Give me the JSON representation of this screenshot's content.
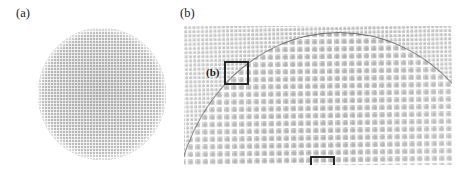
{
  "figure": {
    "background_color": "#ffffff",
    "width": 475,
    "height": 184
  },
  "panels": [
    {
      "id": "a",
      "label": "(a)",
      "description": "circular colloidal crystal monolayer disk with fine square lattice",
      "shape": "circle",
      "fill_color": "#cfcfcf",
      "lattice_pitch_px": 3
    },
    {
      "id": "b",
      "label": "(b)",
      "description": "micrograph showing dome-shaped grain boundary separating coarse inner lattice from fine outer lattice",
      "shape": "rectangle",
      "fill_color": "#e3e3e3",
      "arc_color": "#555555",
      "inner_lattice_pitch_px": 7.4,
      "outer_lattice_pitch_px": 4.2
    }
  ],
  "roi_boxes": [
    {
      "id": "roi-b",
      "label": "(b)",
      "box_color": "#262626",
      "position": "upper-left of panel b"
    },
    {
      "id": "roi-a",
      "label": "(a)",
      "box_color": "#262626",
      "position": "lower-center of panel b"
    }
  ]
}
